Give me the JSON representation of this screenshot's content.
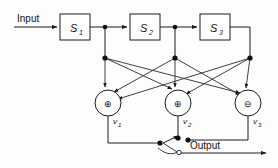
{
  "diagram": {
    "input_label": "Input",
    "output_label": "Output",
    "blocks": [
      {
        "id": "s1",
        "label": "S",
        "sub": "1",
        "x": 60,
        "y": 14,
        "w": 30,
        "h": 26
      },
      {
        "id": "s2",
        "label": "S",
        "sub": "2",
        "x": 130,
        "y": 14,
        "w": 30,
        "h": 26
      },
      {
        "id": "s3",
        "label": "S",
        "sub": "3",
        "x": 200,
        "y": 14,
        "w": 30,
        "h": 26
      }
    ],
    "summers": [
      {
        "id": "v1",
        "symbol": "⊕",
        "label": "v",
        "sub": "1",
        "cx": 108,
        "cy": 103,
        "r": 13
      },
      {
        "id": "v2",
        "symbol": "⊕",
        "label": "v",
        "sub": "2",
        "cx": 178,
        "cy": 103,
        "r": 13
      },
      {
        "id": "v3",
        "symbol": "⊖",
        "label": "v",
        "sub": "3",
        "cx": 248,
        "cy": 103,
        "r": 13
      }
    ],
    "tap_points": [
      {
        "id": "tap1",
        "x": 105,
        "y": 27
      },
      {
        "id": "tap2",
        "x": 175,
        "y": 27
      },
      {
        "id": "fan1",
        "x": 105,
        "y": 58
      },
      {
        "id": "fan2",
        "x": 175,
        "y": 58
      },
      {
        "id": "fan3",
        "x": 250,
        "y": 58
      }
    ],
    "switch": {
      "id": "output-switch",
      "pivot_x": 163,
      "pivot_y": 143,
      "pole_x": 180,
      "pole_y": 152,
      "contacts": [
        {
          "id": "contact-upper",
          "x": 186,
          "y": 140
        },
        {
          "id": "contact-lower",
          "x": 180,
          "y": 152
        }
      ]
    },
    "colors": {
      "line": "#1d1d1d",
      "background": "#fdfdfd",
      "text": "#141414"
    }
  }
}
